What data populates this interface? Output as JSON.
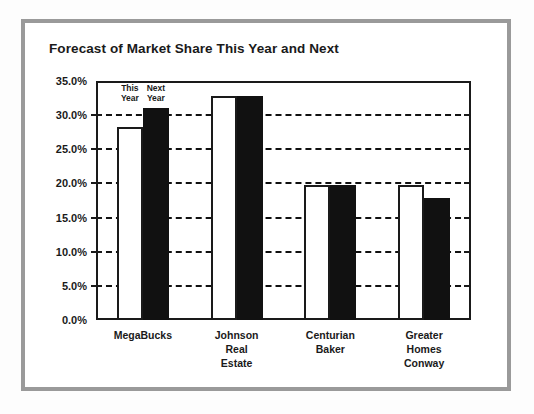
{
  "chart_data": {
    "type": "bar",
    "title": "Forecast of Market Share This Year and Next",
    "xlabel": "",
    "ylabel": "",
    "ylim": [
      0,
      35
    ],
    "ytick_step": 5,
    "ytick_labels": [
      "0.0%",
      "5.0%",
      "10.0%",
      "15.0%",
      "20.0%",
      "25.0%",
      "30.0%",
      "35.0%"
    ],
    "ytick_values": [
      0,
      5,
      10,
      15,
      20,
      25,
      30,
      35
    ],
    "grid": "horizontal-dashed",
    "legend_position": "inside-top-left",
    "categories": [
      [
        "MegaBucks"
      ],
      [
        "Johnson",
        "Real",
        "Estate"
      ],
      [
        "Centurian",
        "Baker"
      ],
      [
        "Greater",
        "Homes",
        "Conway"
      ]
    ],
    "category_names": [
      "MegaBucks",
      "Johnson Real Estate",
      "Centurian Baker",
      "Greater Homes Conway"
    ],
    "series": [
      {
        "name": "This Year",
        "legend_label": [
          "This",
          "Year"
        ],
        "color": "#ffffff",
        "values": [
          28.3,
          32.8,
          19.8,
          19.8
        ]
      },
      {
        "name": "Next Year",
        "legend_label": [
          "Next",
          "Year"
        ],
        "color": "#111111",
        "values": [
          31.1,
          32.8,
          19.8,
          17.8
        ]
      }
    ]
  },
  "colors": {
    "frame": "#9a9a9a",
    "axis": "#1a1a1a",
    "this_year_fill": "#ffffff",
    "next_year_fill": "#111111",
    "page": "#ffffff"
  }
}
